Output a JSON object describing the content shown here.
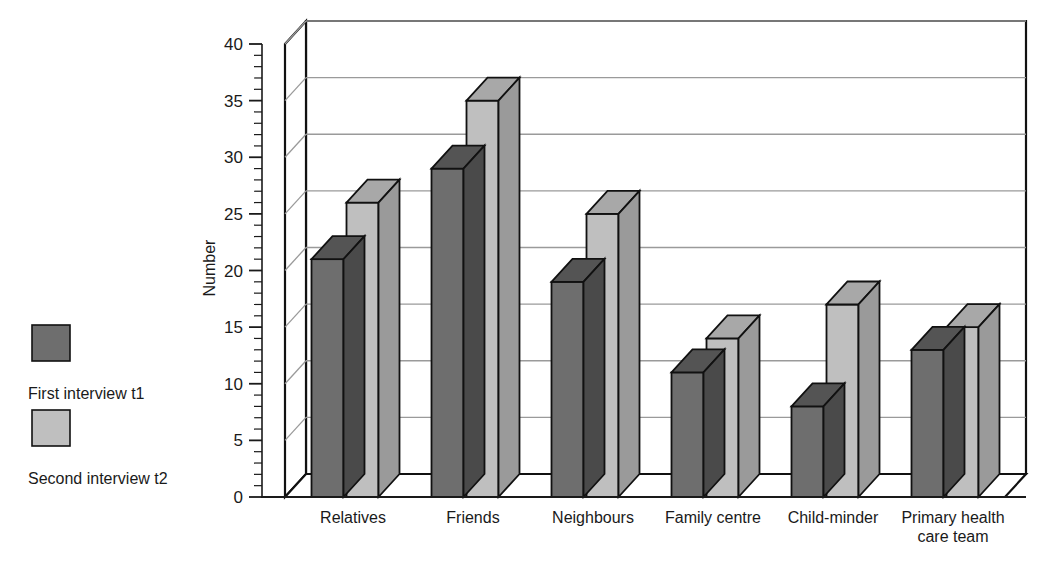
{
  "chart_data": {
    "type": "bar",
    "title": "",
    "subtitle": "",
    "xlabel": "",
    "ylabel": "Number",
    "ylim": [
      0,
      40
    ],
    "ytick_step": 5,
    "yminor_step": 1,
    "grid": true,
    "grid_axis": "y",
    "three_d": true,
    "legend_position": "left",
    "categories": [
      "Relatives",
      "Friends",
      "Neighbours",
      "Family centre",
      "Child-minder",
      "Primary health\ncare team"
    ],
    "ytick_labels": [
      "0",
      "5",
      "10",
      "15",
      "20",
      "25",
      "30",
      "35",
      "40"
    ],
    "series": [
      {
        "name": "First interview t1",
        "color": "#6e6e6e",
        "color_top": "#545454",
        "color_side": "#4a4a4a",
        "values": [
          21,
          29,
          19,
          11,
          8,
          13
        ]
      },
      {
        "name": "Second interview t2",
        "color": "#bfbfbf",
        "color_top": "#a8a8a8",
        "color_side": "#9a9a9a",
        "values": [
          26,
          35,
          25,
          14,
          17,
          15
        ]
      }
    ]
  },
  "legend": {
    "items": [
      {
        "label": "First interview t1",
        "color": "#6e6e6e"
      },
      {
        "label": "Second interview t2",
        "color": "#bfbfbf"
      }
    ]
  },
  "axes": {
    "y_title": "Number",
    "y_max": 40,
    "y_min": 0
  },
  "style": {
    "frame_color": "#111111",
    "grid_color": "#9a9a9a",
    "background": "#ffffff"
  }
}
